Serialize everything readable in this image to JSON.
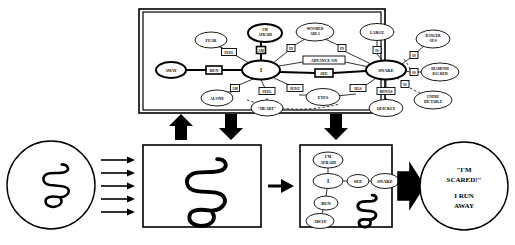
{
  "figure": {
    "title_visible": false,
    "colors": {
      "ink": "#000000",
      "paper": "#ffffff"
    }
  },
  "semantic_network": {
    "panel_label": "semantic-network-panel",
    "concept_nodes": [
      {
        "id": "i",
        "label": "I",
        "emphasis": "bold",
        "x": 118,
        "y": 58,
        "rx": 19,
        "ry": 9.5
      },
      {
        "id": "snake",
        "label": "SNAKE",
        "emphasis": "bold",
        "x": 243,
        "y": 58,
        "rx": 20,
        "ry": 9.5
      },
      {
        "id": "im_afraid",
        "label": "I'M AFRAID",
        "emphasis": "bold",
        "x": 122,
        "y": 21,
        "rx": 17,
        "ry": 9
      },
      {
        "id": "away",
        "label": "AWAY",
        "emphasis": "bold",
        "x": 28,
        "y": 58,
        "rx": 15,
        "ry": 8
      },
      {
        "id": "fear",
        "label": "FEAR",
        "emphasis": "thin",
        "x": 68,
        "y": 28,
        "rx": 16,
        "ry": 8
      },
      {
        "id": "wooded_area",
        "label": "WOODED AREA",
        "emphasis": "thin",
        "x": 172,
        "y": 20,
        "rx": 19,
        "ry": 9
      },
      {
        "id": "large",
        "label": "LARGE",
        "emphasis": "thin",
        "x": 234,
        "y": 20,
        "rx": 17,
        "ry": 8.5
      },
      {
        "id": "dangerous",
        "label": "DANGEROUS",
        "emphasis": "thin",
        "x": 290,
        "y": 27,
        "rx": 17,
        "ry": 9
      },
      {
        "id": "diamond_back",
        "label": "DIAMOND BACKED",
        "emphasis": "thin",
        "x": 297,
        "y": 60,
        "rx": 19,
        "ry": 9
      },
      {
        "id": "alone",
        "label": "ALONE",
        "emphasis": "thin",
        "x": 74,
        "y": 86,
        "rx": 16,
        "ry": 8
      },
      {
        "id": "heart",
        "label": "\"HEART\"",
        "emphasis": "thin",
        "x": 124,
        "y": 96,
        "rx": 16,
        "ry": 8
      },
      {
        "id": "eyes",
        "label": "EYES",
        "emphasis": "thin",
        "x": 180,
        "y": 85,
        "rx": 17,
        "ry": 8.5
      },
      {
        "id": "quickly",
        "label": "QUICKLY",
        "emphasis": "thin",
        "x": 243,
        "y": 96,
        "rx": 17,
        "ry": 8.5
      },
      {
        "id": "unpredict",
        "label": "UNPREDICTABLE",
        "emphasis": "thin",
        "x": 290,
        "y": 88,
        "rx": 19,
        "ry": 9
      }
    ],
    "relation_boxes": [
      {
        "id": "r_feel",
        "label": "FEEL",
        "shape": "box",
        "emphasis": "thin",
        "x": 86,
        "y": 40,
        "w": 15,
        "h": 7
      },
      {
        "id": "r_am",
        "label": "AM",
        "shape": "small",
        "emphasis": "bold",
        "x": 118,
        "y": 38,
        "w": 9,
        "h": 7
      },
      {
        "id": "r_in_left",
        "label": "IN",
        "shape": "small",
        "emphasis": "thin",
        "x": 148,
        "y": 36,
        "w": 8,
        "h": 7
      },
      {
        "id": "r_in_right",
        "label": "IN",
        "shape": "small",
        "emphasis": "thin",
        "x": 199,
        "y": 36,
        "w": 8,
        "h": 7
      },
      {
        "id": "r_is_large",
        "label": "IS",
        "shape": "small",
        "emphasis": "thin",
        "x": 234,
        "y": 38,
        "w": 8,
        "h": 7
      },
      {
        "id": "r_is_dang",
        "label": "IS",
        "shape": "small",
        "emphasis": "thin",
        "x": 271,
        "y": 43,
        "w": 8,
        "h": 7
      },
      {
        "id": "r_is_diam",
        "label": "IS",
        "shape": "small",
        "emphasis": "thin",
        "x": 271,
        "y": 60,
        "w": 8,
        "h": 7
      },
      {
        "id": "r_run",
        "label": "RUN",
        "shape": "box",
        "emphasis": "bold",
        "x": 71,
        "y": 58,
        "w": 16,
        "h": 8
      },
      {
        "id": "r_advance",
        "label": "ADVANCE ON",
        "shape": "box",
        "emphasis": "thin",
        "x": 181,
        "y": 48,
        "w": 42,
        "h": 8
      },
      {
        "id": "r_see",
        "label": "SEE",
        "shape": "box",
        "emphasis": "bold",
        "x": 181,
        "y": 61,
        "w": 18,
        "h": 8
      },
      {
        "id": "r_am_alone",
        "label": "AM",
        "shape": "small",
        "emphasis": "thin",
        "x": 92,
        "y": 76,
        "w": 9,
        "h": 7
      },
      {
        "id": "r_feel2",
        "label": "FEEL",
        "shape": "box",
        "emphasis": "thin",
        "x": 124,
        "y": 79,
        "w": 16,
        "h": 7
      },
      {
        "id": "r_have",
        "label": "HAVE",
        "shape": "box",
        "emphasis": "thin",
        "x": 152,
        "y": 76,
        "w": 16,
        "h": 7
      },
      {
        "id": "r_has",
        "label": "HAS",
        "shape": "box",
        "emphasis": "thin",
        "x": 215,
        "y": 76,
        "w": 16,
        "h": 7
      },
      {
        "id": "r_is_unp",
        "label": "IS",
        "shape": "small",
        "emphasis": "thin",
        "x": 262,
        "y": 72,
        "w": 8,
        "h": 7
      },
      {
        "id": "r_moves",
        "label": "MOVES",
        "shape": "box",
        "emphasis": "thin",
        "x": 243,
        "y": 79,
        "w": 18,
        "h": 7
      }
    ]
  },
  "flow": {
    "stimulus": {
      "label": "stimulus-circle",
      "caption": "",
      "icon": "snake-drawing"
    },
    "arrows_in": {
      "count": 5,
      "direction": "right"
    },
    "percept_panel": {
      "label": "percept-panel",
      "icon": "snake-drawing"
    },
    "transition_arrow": {
      "direction": "right"
    },
    "interpretation_panel": {
      "label": "interpretation-panel",
      "icon": "snake-drawing",
      "nodes": [
        {
          "id": "p_afraid",
          "label": "I'M AFRAID",
          "x": 26,
          "y": 13,
          "rx": 15,
          "ry": 8
        },
        {
          "id": "p_i",
          "label": "I",
          "x": 26,
          "y": 34,
          "rx": 15,
          "ry": 7.5
        },
        {
          "id": "p_see",
          "label": "SEE",
          "x": 56,
          "y": 34,
          "rx": 11,
          "ry": 6.5
        },
        {
          "id": "p_snake",
          "label": "SNAKE",
          "x": 83,
          "y": 34,
          "rx": 14,
          "ry": 7.5
        },
        {
          "id": "p_run",
          "label": "RUN",
          "x": 24,
          "y": 56,
          "rx": 12,
          "ry": 7
        },
        {
          "id": "p_away",
          "label": "AWAY",
          "x": 18,
          "y": 74,
          "rx": 14,
          "ry": 7.5
        }
      ]
    },
    "output_arrow": {
      "direction": "right",
      "style": "block"
    },
    "response": {
      "label": "response-circle",
      "lines": [
        "\"I'M",
        "SCARED!\"",
        "I RUN",
        "AWAY"
      ]
    }
  },
  "connector_arrows": [
    {
      "id": "arrow-up-to-network",
      "direction": "up",
      "x": 181,
      "y": 120
    },
    {
      "id": "arrow-down-to-percept",
      "direction": "down",
      "x": 231,
      "y": 120
    },
    {
      "id": "arrow-down-to-interp",
      "direction": "down",
      "x": 336,
      "y": 120
    }
  ]
}
